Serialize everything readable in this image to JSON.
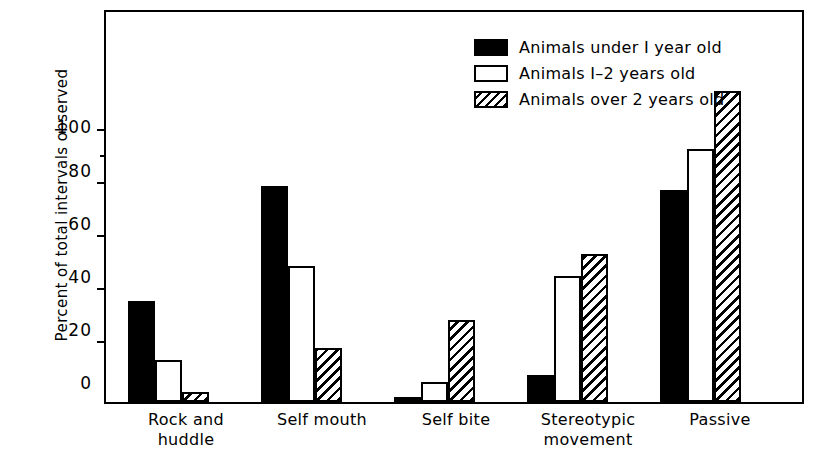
{
  "chart_data": {
    "type": "bar",
    "title": "",
    "xlabel": "",
    "ylabel": "Percent of total intervals observed",
    "ylim": [
      0,
      117
    ],
    "yticks": [
      0,
      20,
      40,
      60,
      80,
      100
    ],
    "grid": false,
    "legend_position": "top-right",
    "categories": [
      "Rock and\nhuddle",
      "Self mouth",
      "Self bite",
      "Stereotypic\nmovement",
      "Passive"
    ],
    "series": [
      {
        "name": "Animals under 1 year old",
        "style": "solid-black",
        "values": [
          30,
          64,
          1.5,
          8,
          63
        ]
      },
      {
        "name": "Animals 1-2 years old",
        "style": "open-white",
        "values": [
          12.5,
          40.5,
          6,
          37.5,
          75
        ]
      },
      {
        "name": "Animals over 2 years old",
        "style": "hatched",
        "values": [
          3,
          16,
          24.5,
          44,
          92.5
        ]
      }
    ]
  },
  "axis": {
    "y_title": "Percent of total intervals observed",
    "y_tick_labels": [
      "100",
      "80",
      "60",
      "40",
      "20",
      "0"
    ]
  },
  "legend": {
    "items": [
      {
        "label": "Animals under I year old",
        "swatch": "solid-swatch-icon"
      },
      {
        "label": "Animals I–2 years old",
        "swatch": "open-swatch-icon"
      },
      {
        "label": "Animals over 2 years old",
        "swatch": "hatched-swatch-icon"
      }
    ]
  },
  "categories_display": {
    "c0": "Rock and\nhuddle",
    "c1": "Self mouth",
    "c2": "Self bite",
    "c3": "Stereotypic\nmovement",
    "c4": "Passive"
  }
}
